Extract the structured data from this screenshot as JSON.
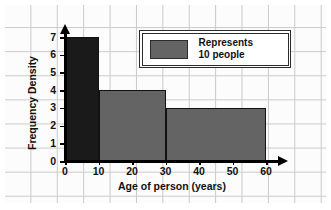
{
  "chart_data": {
    "type": "bar",
    "title": "",
    "subtitle": "",
    "xlabel": "Age of person (years)",
    "ylabel": "Frequency Density",
    "xlim": [
      0,
      60
    ],
    "ylim": [
      0,
      7
    ],
    "xticks": [
      "0",
      "10",
      "20",
      "30",
      "40",
      "50",
      "60"
    ],
    "xtick_values": [
      0,
      10,
      20,
      30,
      40,
      50,
      60
    ],
    "yticks": [
      "0",
      "1",
      "2",
      "3",
      "4",
      "5",
      "6",
      "7"
    ],
    "ytick_values": [
      0,
      1,
      2,
      3,
      4,
      5,
      6,
      7
    ],
    "grid": true,
    "legend_position": "top-right",
    "histogram_bins": [
      {
        "label": "0-10",
        "x_start": 0,
        "x_end": 10,
        "value": 7,
        "color": "#1a1a1a",
        "frequency": 70
      },
      {
        "label": "10-30",
        "x_start": 10,
        "x_end": 30,
        "value": 4,
        "color": "#646464",
        "frequency": 80
      },
      {
        "label": "30-60",
        "x_start": 30,
        "x_end": 60,
        "value": 3,
        "color": "#646464",
        "frequency": 90
      }
    ],
    "categories": [
      "0-10",
      "10-30",
      "30-60"
    ],
    "values": [
      7,
      4,
      3
    ],
    "annotations": [
      "Represents 10 people"
    ]
  },
  "legend": {
    "text": "Represents\n10 people",
    "swatch_color": "#646464"
  },
  "colors": {
    "bar_dark": "#1a1a1a",
    "bar_gray": "#646464",
    "axis": "#000000",
    "grid_line": "#c9c9c9",
    "paper": "#fcfcfc",
    "text": "#111111"
  }
}
